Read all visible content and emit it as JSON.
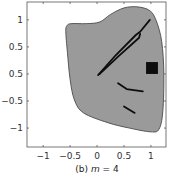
{
  "chart_data": {
    "type": "area",
    "title": "",
    "caption": {
      "prefix": "(b) ",
      "variable": "m",
      "suffix": " = 4"
    },
    "xlabel": "",
    "ylabel": "",
    "xlim": [
      -1.3,
      1.28
    ],
    "ylim": [
      -1.35,
      1.33
    ],
    "grid": false,
    "x_ticks": [
      {
        "value": -1,
        "label": "−1"
      },
      {
        "value": -0.5,
        "label": "−0.5"
      },
      {
        "value": 0,
        "label": "0"
      },
      {
        "value": 0.5,
        "label": "0.5"
      },
      {
        "value": 1,
        "label": "1"
      }
    ],
    "y_ticks": [
      {
        "value": 1,
        "label": "1"
      },
      {
        "value": 0.5,
        "label": "0.5"
      },
      {
        "value": 0,
        "label": "0.5"
      },
      {
        "value": -0.5,
        "label": "−0.5"
      },
      {
        "value": -1,
        "label": "−1"
      }
    ],
    "colors": {
      "region_fill": "#9a9a9a",
      "region_edge": "#4a4a4a",
      "mark": "#0d0d0d",
      "axis": "#555555"
    },
    "region_boundary": [
      [
        -0.56,
        0.89
      ],
      [
        -0.48,
        0.93
      ],
      [
        -0.2,
        0.93
      ],
      [
        0.05,
        0.96
      ],
      [
        0.25,
        1.1
      ],
      [
        0.5,
        1.22
      ],
      [
        0.75,
        1.24
      ],
      [
        0.98,
        1.17
      ],
      [
        1.1,
        0.98
      ],
      [
        1.2,
        0.6
      ],
      [
        1.24,
        0.0
      ],
      [
        1.22,
        -0.7
      ],
      [
        1.15,
        -1.02
      ],
      [
        1.0,
        -1.07
      ],
      [
        0.6,
        -1.0
      ],
      [
        0.2,
        -0.9
      ],
      [
        -0.25,
        -0.72
      ],
      [
        -0.42,
        -0.48
      ],
      [
        -0.5,
        -0.1
      ],
      [
        -0.55,
        0.4
      ],
      [
        -0.58,
        0.78
      ]
    ],
    "square": {
      "x": [
        0.91,
        1.13
      ],
      "y": [
        0.0,
        0.22
      ]
    },
    "marks": [
      {
        "name": "long-crack-a",
        "points": [
          [
            0.02,
            -0.02
          ],
          [
            0.35,
            0.35
          ],
          [
            0.72,
            0.72
          ],
          [
            0.8,
            0.78
          ],
          [
            0.98,
            1.0
          ]
        ]
      },
      {
        "name": "long-crack-b",
        "points": [
          [
            0.05,
            0.0
          ],
          [
            0.4,
            0.33
          ],
          [
            0.78,
            0.67
          ],
          [
            0.8,
            0.74
          ]
        ]
      },
      {
        "name": "mid-crack",
        "points": [
          [
            0.39,
            -0.17
          ],
          [
            0.55,
            -0.28
          ],
          [
            0.85,
            -0.32
          ]
        ]
      },
      {
        "name": "low-crack",
        "points": [
          [
            0.5,
            -0.6
          ],
          [
            0.7,
            -0.72
          ]
        ]
      }
    ]
  }
}
